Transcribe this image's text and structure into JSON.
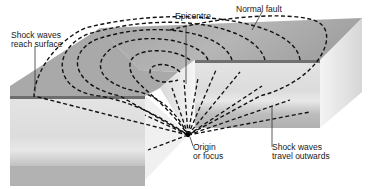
{
  "figure": {
    "type": "block diagram"
  },
  "labels": {
    "shock_waves_surface_line1": "Shock waves",
    "shock_waves_surface_line2": "reach surface",
    "epicentre": "Epicentre",
    "normal_fault": "Normal fault",
    "origin_line1": "Origin",
    "origin_line2": "or focus",
    "shock_waves_travel_line1": "Shock waves",
    "shock_waves_travel_line2": "travel outwards"
  },
  "colors": {
    "top_surface": "#a8a8a8",
    "top_surface_light": "#c4c4c4",
    "front_face_light": "#e6e6e6",
    "front_face_band": "#d2d2d2",
    "front_face_bottom": "#b4b4b4",
    "dark_stratum": "#6e6e6e",
    "side_face": "#ececec",
    "wave_lines": "#111111",
    "leader_lines": "#333333"
  }
}
